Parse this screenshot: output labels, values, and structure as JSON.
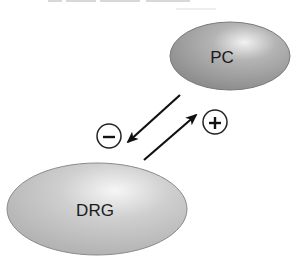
{
  "diagram": {
    "nodes": [
      {
        "id": "pc",
        "label": "PC",
        "cx": 230,
        "cy": 56,
        "rx": 60,
        "ry": 34,
        "fill": "#9a9a9a",
        "highlight": "#f0f0f0"
      },
      {
        "id": "drg",
        "label": "DRG",
        "cx": 97,
        "cy": 209,
        "rx": 90,
        "ry": 46,
        "fill": "#c4c4c4",
        "highlight": "#f4f4f4"
      }
    ],
    "edges": [
      {
        "from": "pc",
        "to": "drg",
        "sign": "−",
        "sign_name": "minus",
        "effect": "inhibitory"
      },
      {
        "from": "drg",
        "to": "pc",
        "sign": "+",
        "sign_name": "plus",
        "effect": "excitatory"
      }
    ],
    "colors": {
      "line": "#111111",
      "background": "#ffffff"
    }
  }
}
